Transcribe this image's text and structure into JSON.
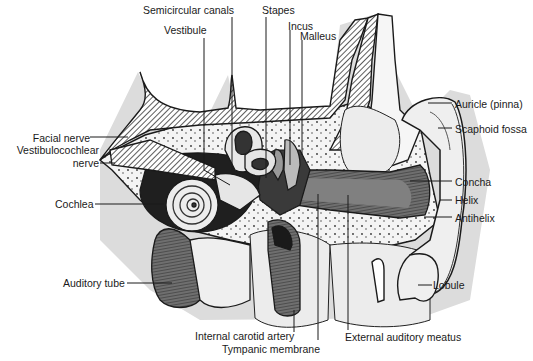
{
  "diagram": {
    "colors": {
      "line": "#1a1a1a",
      "bone_fill": "#f2f2f2",
      "halo": "#d9d9d9",
      "canal_fill": "#7a7a7a",
      "hatch": "#555555",
      "air_cells": "#e6e6e6"
    },
    "labels": {
      "semicircular_canals": "Semicircular canals",
      "stapes": "Stapes",
      "incus": "Incus",
      "malleus": "Malleus",
      "vestibule": "Vestibule",
      "auricle": "Auricle (pinna)",
      "scaphoid_fossa": "Scaphoid fossa",
      "facial_nerve": "Facial nerve",
      "vestibulocochlear_nerve_1": "Vestibulocochlear",
      "vestibulocochlear_nerve_2": "nerve",
      "cochlea": "Cochlea",
      "concha": "Concha",
      "helix": "Helix",
      "antihelix": "Antihelix",
      "auditory_tube": "Auditory tube",
      "lobule": "Lobule",
      "internal_carotid_artery": "Internal carotid artery",
      "tympanic_membrane": "Tympanic membrane",
      "external_auditory_meatus": "External auditory meatus"
    }
  }
}
